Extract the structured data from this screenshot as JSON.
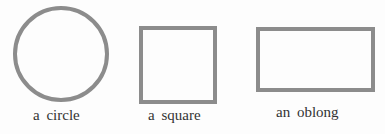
{
  "figure": {
    "shapes": [
      {
        "type": "circle",
        "label": "a circle"
      },
      {
        "type": "square",
        "label": "a square"
      },
      {
        "type": "oblong",
        "label": "an oblong"
      }
    ],
    "stroke_color": "#8c8c8c"
  }
}
